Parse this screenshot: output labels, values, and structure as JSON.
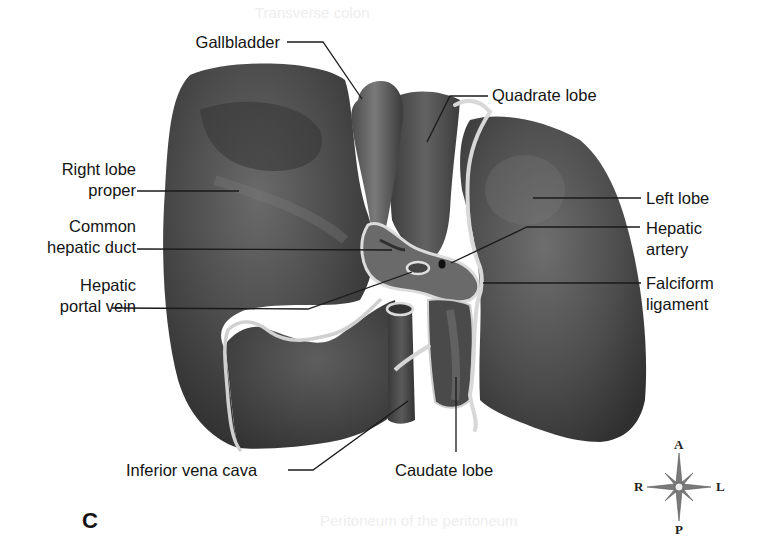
{
  "figure": {
    "panel_letter": "C",
    "colors": {
      "background": "#ffffff",
      "liver_dark": "#3c3c3c",
      "liver_mid": "#5a5a5a",
      "liver_highlight": "#8a8a8a",
      "ligament": "#d8d8d8",
      "leader_line": "#1a1a1a",
      "label_text": "#141414"
    }
  },
  "labels": {
    "gallbladder": "Gallbladder",
    "quadrate_lobe": "Quadrate lobe",
    "right_lobe_line1": "Right lobe",
    "right_lobe_line2": "proper",
    "common_hepatic_duct_line1": "Common",
    "common_hepatic_duct_line2": "hepatic duct",
    "left_lobe": "Left lobe",
    "hepatic_artery_line1": "Hepatic",
    "hepatic_artery_line2": "artery",
    "hepatic_portal_vein_line1": "Hepatic",
    "hepatic_portal_vein_line2": "portal vein",
    "falciform_ligament_line1": "Falciform",
    "falciform_ligament_line2": "ligament",
    "inferior_vena_cava": "Inferior vena cava",
    "caudate_lobe": "Caudate lobe"
  },
  "compass": {
    "anterior": "A",
    "posterior": "P",
    "right": "R",
    "left": "L"
  },
  "ghost_text": {
    "top": "Transverse colon",
    "bottom": "Peritoneum of the peritoneum"
  }
}
